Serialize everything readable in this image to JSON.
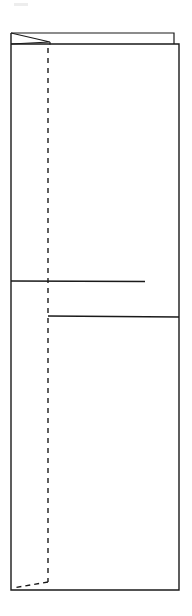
{
  "figure": {
    "background_color": "#ffffff",
    "line_color": "#1a1a1a",
    "canvas": {
      "width": 192,
      "height": 616
    },
    "elements": {
      "back_panel": {
        "name": "back-panel-outline",
        "top_edge_y": 33,
        "left_x": 11,
        "right_x": 174,
        "stroke_width": 1.2,
        "points": "11,33 174,33 174,44"
      },
      "front_panel": {
        "name": "front-panel-outline",
        "top_edge_y": 44,
        "bottom_edge_y": 590,
        "left_x": 11,
        "right_x": 179,
        "stroke_width": 1.4,
        "points": "11,33 11,590 179,590 179,44 11,44"
      },
      "corner_flap": {
        "name": "triangular-corner-flap",
        "stroke_width": 1.2,
        "apex_x": 50,
        "apex_y": 42,
        "points": "11,33 50,42 11,44"
      },
      "flap_edge": {
        "name": "flap-vertical-edge",
        "x": 50,
        "y_top": 42,
        "y_bottom": 44,
        "stroke_width": 1.2
      },
      "fold_line_vertical": {
        "name": "vertical-fold-line",
        "x": 48,
        "y_top": 48,
        "y_bottom": 582,
        "stroke_width": 1.4,
        "dash_pattern": "5 5"
      },
      "fold_line_bottom": {
        "name": "bottom-fold-line",
        "from_x": 48,
        "from_y": 582,
        "to_x": 13,
        "to_y": 588,
        "stroke_width": 1.4,
        "dash_pattern": "5 4"
      },
      "crease_upper": {
        "name": "upper-crease-line",
        "y": 281,
        "from_x": 11,
        "to_x": 145,
        "stroke_width": 1.5
      },
      "crease_lower": {
        "name": "lower-crease-line",
        "y": 316,
        "from_x": 48,
        "to_x": 179,
        "stroke_width": 1.5
      },
      "scan_artifact": {
        "name": "scan-artifact-mark",
        "x": 14,
        "y": 3,
        "width": 14,
        "height": 3
      }
    }
  }
}
